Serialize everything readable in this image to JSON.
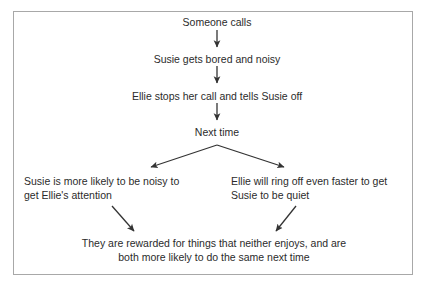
{
  "diagram": {
    "title_text": "Someone calls",
    "nodes": [
      {
        "id": "someone-calls",
        "text": "Someone calls"
      },
      {
        "id": "susie-bored",
        "text": "Susie gets bored and noisy"
      },
      {
        "id": "ellie-stops-call",
        "text": "Ellie stops her call and tells Susie off"
      },
      {
        "id": "next-time",
        "text": "Next time"
      }
    ],
    "branches": {
      "left": {
        "line1": "Susie is more likely to be noisy to",
        "line2": "get Ellie's attention"
      },
      "right": {
        "line1": "Ellie will ring off even faster to get",
        "line2": "Susie to be quiet"
      }
    },
    "conclusion": {
      "line1": "They are rewarded for things that neither enjoys, and are",
      "line2": "both more likely to do the same next time"
    },
    "colors": {
      "text": "#2b2b2b",
      "border": "#a8a8a8",
      "arrow": "#333333",
      "background": "#ffffff"
    }
  }
}
